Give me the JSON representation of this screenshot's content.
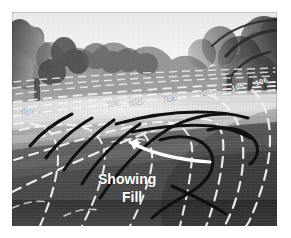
{
  "figure": {
    "kind": "annotated-photograph",
    "palette": {
      "page_background": "#ffffff",
      "photo_border": "#ffffff",
      "sky": "#f4f4f4",
      "tree_canopy_dark": "#3a3a3a",
      "tree_canopy_mid": "#6a6a6a",
      "fairway_light": "#cfcfcf",
      "fairway_mid": "#8e8e8e",
      "fairway_dark": "#565656",
      "foreground_turf": "#4a4a4a",
      "contour_line": "#f2f2f2",
      "fill_line": "#121212",
      "arrow": "#ffffff",
      "label_text": "#fdfdfd"
    },
    "photo_frame": {
      "x": 12,
      "y": 12,
      "width": 265,
      "height": 214
    }
  },
  "annotations": {
    "callout": {
      "name": "showing-fill-callout",
      "lines": [
        "Showing",
        "Fill"
      ],
      "line1": "Showing",
      "line2": "Fill",
      "style": "handwritten white block letters",
      "x": 98,
      "y": 152
    },
    "arrow": {
      "name": "callout-arrow",
      "description": "curved white arrow sweeping from lower right up to the left, pointing at the drawn fill lines",
      "color": "#ffffff",
      "points_to": "fill-lines"
    },
    "contour_labels": [
      {
        "value": "100",
        "x": 22,
        "y": 113
      },
      {
        "value": "101",
        "x": 110,
        "y": 105
      },
      {
        "value": "102",
        "x": 133,
        "y": 104
      },
      {
        "value": "103",
        "x": 167,
        "y": 101
      },
      {
        "value": "104",
        "x": 203,
        "y": 96
      },
      {
        "value": "105",
        "x": 235,
        "y": 92
      },
      {
        "value": "106",
        "x": 259,
        "y": 88
      }
    ],
    "contour_interval": "1 unit",
    "contour_style": "white dashed",
    "fill_lines": {
      "name": "proposed-fill-lines",
      "count": 8,
      "color": "#121212",
      "style": "solid heavy hand-drawn",
      "description": "black drawn lines over the fairway indicating proposed fill / regraded contours"
    }
  }
}
